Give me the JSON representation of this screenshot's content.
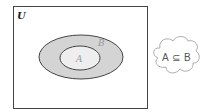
{
  "diagram": {
    "type": "venn",
    "universe_label": "U",
    "sets": [
      {
        "name": "B",
        "label": "B",
        "fill": "#d4d4d4",
        "stroke": "#444444"
      },
      {
        "name": "A",
        "label": "A",
        "fill": "#eeeeee",
        "stroke": "#444444"
      }
    ],
    "relation": "A ⊆ B",
    "callout": {
      "shape": "cloud",
      "text_left": "A",
      "symbol": "⊆",
      "text_right": "B"
    },
    "colors": {
      "frame": "#444444",
      "outer_set_fill": "#d4d4d4",
      "inner_set_fill": "#eeeeee",
      "label_color": "#999999",
      "universe_label_color": "#222222"
    }
  }
}
